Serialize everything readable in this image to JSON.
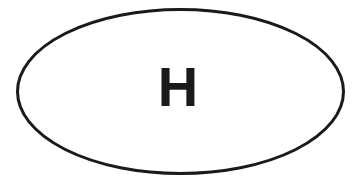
{
  "diagram": {
    "shape": "ellipse",
    "stroke_color": "#1a1a1a",
    "fill_color": "#ffffff",
    "label": "H",
    "label_color": "#1a1a1a"
  }
}
